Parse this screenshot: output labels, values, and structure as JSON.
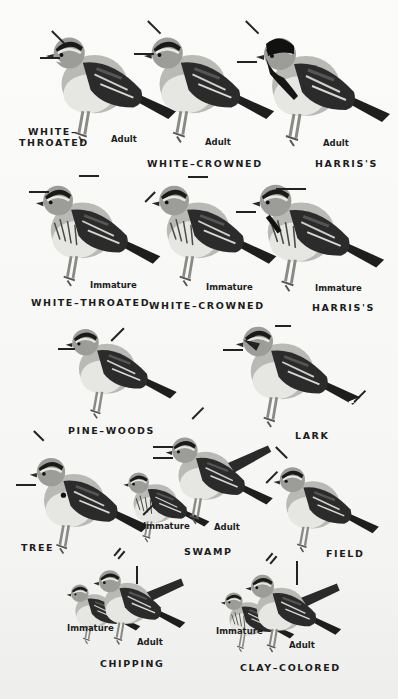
{
  "plate": {
    "subject": "Sparrows",
    "background_color": "#f7f7f5",
    "ink_color": "#1c1c1c"
  },
  "rows": [
    {
      "row": 1,
      "birds": [
        {
          "id": "white-throated-adult",
          "species": "WHITE-THROATED",
          "species_lines": [
            "WHITE–",
            "THROATED"
          ],
          "age": "Adult"
        },
        {
          "id": "white-crowned-adult",
          "species": "WHITE-CROWNED",
          "species_label": "WHITE–CROWNED",
          "age": "Adult"
        },
        {
          "id": "harris-adult",
          "species": "HARRIS'S",
          "species_label": "HARRIS'S",
          "age": "Adult"
        }
      ]
    },
    {
      "row": 2,
      "birds": [
        {
          "id": "white-throated-immature",
          "species": "WHITE-THROATED",
          "species_label": "WHITE–THROATED",
          "age": "Immature"
        },
        {
          "id": "white-crowned-immature",
          "species": "WHITE-CROWNED",
          "species_label": "WHITE–CROWNED",
          "age": "Immature"
        },
        {
          "id": "harris-immature",
          "species": "HARRIS'S",
          "species_label": "HARRIS'S",
          "age": "Immature"
        }
      ]
    },
    {
      "row": 3,
      "birds": [
        {
          "id": "pine-woods",
          "species": "PINE-WOODS",
          "species_label": "PINE–WOODS"
        },
        {
          "id": "lark",
          "species": "LARK",
          "species_label": "LARK"
        }
      ]
    },
    {
      "row": 4,
      "birds": [
        {
          "id": "tree",
          "species": "TREE",
          "species_label": "TREE"
        },
        {
          "id": "swamp",
          "species": "SWAMP",
          "species_label": "SWAMP",
          "ages": [
            "Immature",
            "Adult"
          ]
        },
        {
          "id": "field",
          "species": "FIELD",
          "species_label": "FIELD"
        }
      ]
    },
    {
      "row": 5,
      "birds": [
        {
          "id": "chipping",
          "species": "CHIPPING",
          "species_label": "CHIPPING",
          "ages": [
            "Immature",
            "Adult"
          ]
        },
        {
          "id": "clay-colored",
          "species": "CLAY-COLORED",
          "species_label": "CLAY–COLORED",
          "ages": [
            "Immature",
            "Adult"
          ]
        }
      ]
    }
  ]
}
